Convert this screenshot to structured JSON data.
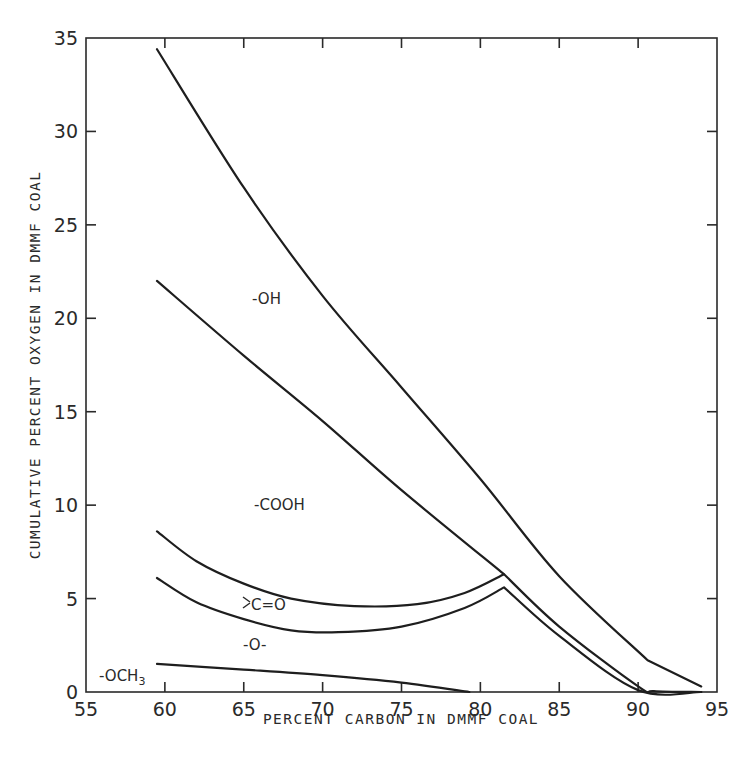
{
  "chart_data": {
    "type": "line",
    "title": "",
    "xlabel": "PERCENT CARBON IN DMMF COAL",
    "ylabel": "CUMULATIVE PERCENT OXYGEN IN DMMF COAL",
    "xlim": [
      55,
      95
    ],
    "ylim": [
      0,
      35
    ],
    "x_ticks": [
      55,
      60,
      65,
      70,
      75,
      80,
      85,
      90,
      95
    ],
    "y_ticks": [
      0,
      5,
      10,
      15,
      20,
      25,
      30,
      35
    ],
    "grid": false,
    "legend": "none (regions labeled inline)",
    "series": [
      {
        "name": "-OH (total oxygen upper boundary)",
        "x": [
          59.5,
          65,
          70,
          75,
          80,
          85,
          90.6,
          94
        ],
        "y": [
          34.4,
          27.0,
          21.2,
          16.3,
          11.4,
          6.2,
          1.7,
          0.3
        ]
      },
      {
        "name": "-COOH (boundary below -OH)",
        "x": [
          59.5,
          65,
          70,
          75,
          81.5,
          85,
          90,
          91,
          94
        ],
        "y": [
          22.0,
          18.0,
          14.5,
          10.8,
          6.3,
          3.5,
          0.3,
          0.05,
          0.0
        ]
      },
      {
        "name": ">C=O (boundary below -COOH)",
        "x": [
          59.5,
          62,
          65,
          68,
          72,
          76,
          79,
          81.5
        ],
        "y": [
          8.6,
          7.0,
          5.8,
          5.0,
          4.6,
          4.7,
          5.3,
          6.3
        ]
      },
      {
        "name": "-O- (boundary below >C=O)",
        "x": [
          59.5,
          62,
          65,
          68,
          71,
          75,
          79,
          81.5,
          85,
          90,
          94
        ],
        "y": [
          6.1,
          4.8,
          3.9,
          3.3,
          3.2,
          3.5,
          4.5,
          5.6,
          3.0,
          0.1,
          0.0
        ]
      },
      {
        "name": "-OCH3",
        "x": [
          59.5,
          65,
          70,
          75,
          79.3
        ],
        "y": [
          1.5,
          1.2,
          0.9,
          0.5,
          0.0
        ]
      }
    ],
    "annotations": [
      {
        "text": "-OH",
        "x": 66,
        "y": 21
      },
      {
        "text": "-COOH",
        "x": 66,
        "y": 10
      },
      {
        "text": ">C=O",
        "x": 65.5,
        "y": 4.6
      },
      {
        "text": "-O-",
        "x": 65.5,
        "y": 2.5
      },
      {
        "text": "-OCH3",
        "x": 56.5,
        "y": 0.9
      }
    ]
  },
  "labels": {
    "xlabel": "PERCENT CARBON IN DMMF COAL",
    "ylabel": "CUMULATIVE PERCENT OXYGEN IN DMMF COAL",
    "oh": "-OH",
    "cooh": "-COOH",
    "co": "C=O",
    "o": "-O-",
    "och3_main": "-OCH",
    "och3_sub": "3"
  }
}
